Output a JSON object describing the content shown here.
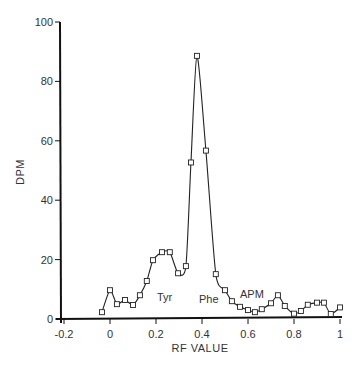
{
  "chart_data": {
    "type": "line",
    "title": "",
    "xlabel": "RF VALUE",
    "ylabel": "DPM",
    "xlim": [
      -0.2,
      1.0
    ],
    "ylim": [
      0,
      100
    ],
    "x_ticks": [
      -0.2,
      0,
      0.2,
      0.4,
      0.6,
      0.8,
      1
    ],
    "x_tick_labels": [
      "-0.2",
      "0",
      "0.2",
      "0.4",
      "0.6",
      "0.8",
      "1"
    ],
    "y_ticks": [
      0,
      20,
      40,
      60,
      80,
      100
    ],
    "y_tick_labels": [
      "0",
      "20",
      "40",
      "60",
      "80",
      "100"
    ],
    "grid": false,
    "legend": null,
    "marker": "square",
    "series": [
      {
        "name": "DPM",
        "x": [
          -0.035,
          0.0,
          0.03,
          0.065,
          0.1,
          0.13,
          0.16,
          0.187,
          0.226,
          0.26,
          0.296,
          0.33,
          0.352,
          0.378,
          0.417,
          0.46,
          0.5,
          0.53,
          0.565,
          0.6,
          0.63,
          0.66,
          0.7,
          0.73,
          0.76,
          0.8,
          0.83,
          0.86,
          0.9,
          0.93,
          0.96,
          1.0
        ],
        "values": [
          2.3,
          9.7,
          5.0,
          6.4,
          4.7,
          8.0,
          12.8,
          19.8,
          22.5,
          22.5,
          15.4,
          17.8,
          52.7,
          88.6,
          56.7,
          15.1,
          9.7,
          6.0,
          4.1,
          3.0,
          2.3,
          3.3,
          5.3,
          8.0,
          4.4,
          1.8,
          2.7,
          4.8,
          5.5,
          5.5,
          1.7,
          3.9
        ]
      }
    ],
    "annotations": [
      {
        "text": "Tyr",
        "x": 0.22,
        "y": 8
      },
      {
        "text": "Phe",
        "x": 0.4,
        "y": 6
      },
      {
        "text": "APM",
        "x": 0.56,
        "y": 8
      }
    ]
  },
  "labels": {
    "xlabel": "RF VALUE",
    "ylabel": "DPM",
    "tyr": "Tyr",
    "phe": "Phe",
    "apm": "APM"
  },
  "colors": {
    "line": "#222222",
    "marker_fill": "#ffffff",
    "axis": "#111111"
  }
}
